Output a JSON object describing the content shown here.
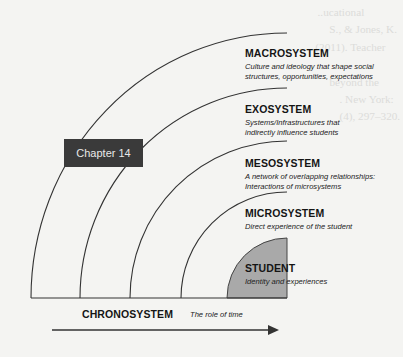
{
  "diagram": {
    "badge": {
      "label": "Chapter 14",
      "color": "#3a3a3a"
    },
    "layers": [
      {
        "name": "MACROSYSTEM",
        "description_lines": [
          "Culture and ideology that shape social",
          "structures, opportunities, expectations"
        ]
      },
      {
        "name": "EXOSYSTEM",
        "description_lines": [
          "Systems/Infrastructures that",
          "indirectly influence students"
        ]
      },
      {
        "name": "MESOSYSTEM",
        "description_lines": [
          "A network of overlapping relationships:",
          "Interactions of microsystems"
        ]
      },
      {
        "name": "MICROSYSTEM",
        "description_lines": [
          "Direct experience of the student"
        ]
      },
      {
        "name": "STUDENT",
        "description_lines": [
          "Identity and experiences"
        ],
        "fill": "#a9a9a9"
      }
    ],
    "timeline": {
      "name": "CHRONOSYSTEM",
      "description": "The role of time"
    }
  }
}
